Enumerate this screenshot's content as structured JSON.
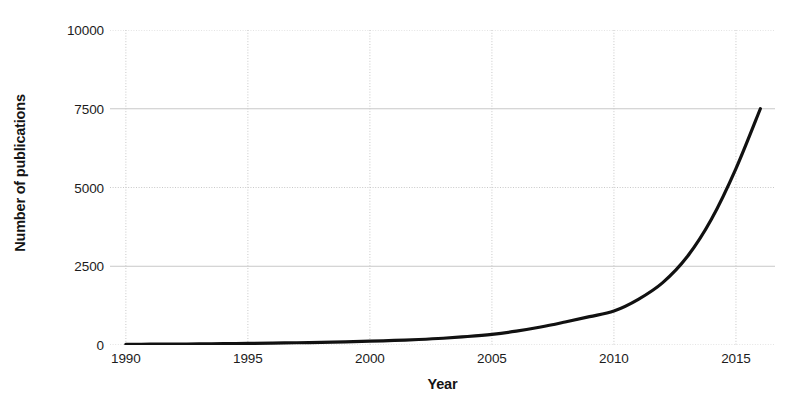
{
  "chart_data": {
    "type": "line",
    "title": "",
    "xlabel": "Year",
    "ylabel": "Number of publications",
    "xlim": [
      1989.35,
      1989.35
    ],
    "xlim_values": [
      1989.35,
      2016.6
    ],
    "ylim": [
      0,
      10000
    ],
    "grid": true,
    "legend": false,
    "xticks": [
      1990,
      1995,
      2000,
      2005,
      2010,
      2015
    ],
    "xtick_labels": [
      "1990",
      "1995",
      "2000",
      "2005",
      "2010",
      "2015"
    ],
    "yticks": [
      0,
      2500,
      5000,
      7500,
      10000
    ],
    "ytick_labels": [
      "0",
      "2500",
      "5000",
      "7500",
      "10000"
    ],
    "line_color": "#111111",
    "grid_color": "#c8c8c8",
    "series": [
      {
        "name": "Number of publications",
        "x": [
          1990,
          1991,
          1992,
          1993,
          1994,
          1995,
          1996,
          1997,
          1998,
          1999,
          2000,
          2001,
          2002,
          2003,
          2004,
          2005,
          2006,
          2007,
          2008,
          2009,
          2010,
          2011,
          2012,
          2013,
          2014,
          2015,
          2016
        ],
        "values": [
          20,
          25,
          30,
          35,
          42,
          50,
          60,
          72,
          85,
          100,
          120,
          145,
          175,
          215,
          270,
          340,
          440,
          570,
          730,
          900,
          1080,
          1450,
          1980,
          2800,
          4000,
          5600,
          7500
        ]
      }
    ],
    "annotations": []
  }
}
